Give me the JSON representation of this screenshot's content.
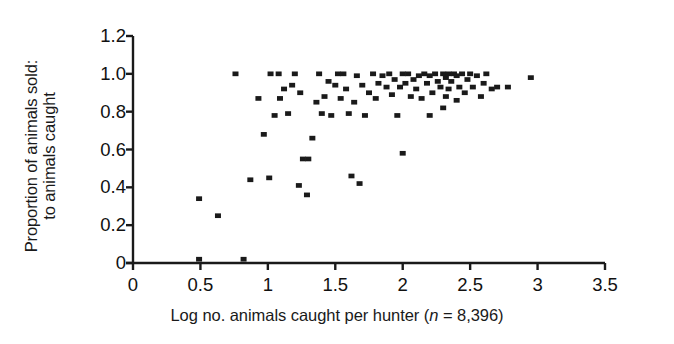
{
  "chart_data": {
    "type": "scatter",
    "title": "",
    "xlabel": "Log no. animals caught per hunter (n = 8,396)",
    "xlabel_parts": {
      "before": "Log no. animals caught per hunter (",
      "italic": "n",
      "after": " = 8,396)"
    },
    "ylabel": "Proportion of animals sold: to animals caught",
    "ylabel_lines": [
      "Proportion of animals sold:",
      "to animals caught"
    ],
    "xlim": [
      0,
      3.5
    ],
    "ylim": [
      0,
      1.2
    ],
    "xticks": [
      0,
      0.5,
      1,
      1.5,
      2,
      2.5,
      3,
      3.5
    ],
    "xtick_labels": [
      "0",
      "0.5",
      "1",
      "1.5",
      "2",
      "2.5",
      "3",
      "3.5"
    ],
    "yticks": [
      0,
      0.2,
      0.4,
      0.6,
      0.8,
      1.0,
      1.2
    ],
    "ytick_labels": [
      "0",
      "0.2",
      "0.4",
      "0.6",
      "0.8",
      "1.0",
      "1.2"
    ],
    "grid": false,
    "legend": null,
    "marker": "square",
    "marker_color": "#1a1a1a",
    "marker_size_px": 6,
    "n_points": 93,
    "points": [
      [
        0.49,
        0.02
      ],
      [
        0.49,
        0.34
      ],
      [
        0.63,
        0.25
      ],
      [
        0.76,
        1.0
      ],
      [
        0.82,
        0.02
      ],
      [
        0.87,
        0.44
      ],
      [
        0.93,
        0.87
      ],
      [
        0.97,
        0.68
      ],
      [
        1.01,
        0.45
      ],
      [
        1.02,
        1.0
      ],
      [
        1.05,
        0.78
      ],
      [
        1.08,
        1.0
      ],
      [
        1.09,
        0.87
      ],
      [
        1.12,
        0.92
      ],
      [
        1.15,
        0.79
      ],
      [
        1.18,
        0.94
      ],
      [
        1.2,
        1.0
      ],
      [
        1.23,
        0.41
      ],
      [
        1.24,
        0.9
      ],
      [
        1.26,
        0.55
      ],
      [
        1.29,
        0.36
      ],
      [
        1.3,
        0.55
      ],
      [
        1.33,
        0.66
      ],
      [
        1.36,
        0.85
      ],
      [
        1.38,
        1.0
      ],
      [
        1.4,
        0.79
      ],
      [
        1.42,
        0.88
      ],
      [
        1.45,
        0.96
      ],
      [
        1.47,
        0.78
      ],
      [
        1.5,
        0.94
      ],
      [
        1.52,
        1.0
      ],
      [
        1.54,
        0.87
      ],
      [
        1.56,
        1.0
      ],
      [
        1.58,
        0.92
      ],
      [
        1.6,
        0.79
      ],
      [
        1.62,
        0.46
      ],
      [
        1.64,
        0.85
      ],
      [
        1.66,
        0.99
      ],
      [
        1.68,
        0.42
      ],
      [
        1.7,
        0.94
      ],
      [
        1.72,
        0.78
      ],
      [
        1.75,
        0.9
      ],
      [
        1.78,
        1.0
      ],
      [
        1.8,
        0.87
      ],
      [
        1.82,
        0.95
      ],
      [
        1.85,
        0.99
      ],
      [
        1.88,
        0.93
      ],
      [
        1.9,
        1.0
      ],
      [
        1.92,
        0.89
      ],
      [
        1.94,
        0.97
      ],
      [
        1.96,
        0.78
      ],
      [
        1.98,
        0.93
      ],
      [
        2.0,
        0.58
      ],
      [
        2.0,
        1.0
      ],
      [
        2.02,
        0.95
      ],
      [
        2.04,
        1.0
      ],
      [
        2.06,
        0.88
      ],
      [
        2.08,
        0.97
      ],
      [
        2.1,
        0.92
      ],
      [
        2.12,
        0.99
      ],
      [
        2.14,
        0.87
      ],
      [
        2.16,
        1.0
      ],
      [
        2.18,
        0.95
      ],
      [
        2.2,
        0.78
      ],
      [
        2.2,
        0.99
      ],
      [
        2.22,
        0.9
      ],
      [
        2.24,
        1.0
      ],
      [
        2.26,
        0.96
      ],
      [
        2.28,
        0.93
      ],
      [
        2.3,
        1.0
      ],
      [
        2.3,
        0.82
      ],
      [
        2.32,
        0.98
      ],
      [
        2.32,
        0.88
      ],
      [
        2.34,
        1.0
      ],
      [
        2.34,
        0.92
      ],
      [
        2.36,
        0.96
      ],
      [
        2.38,
        1.0
      ],
      [
        2.4,
        0.86
      ],
      [
        2.4,
        0.99
      ],
      [
        2.42,
        0.93
      ],
      [
        2.44,
        1.0
      ],
      [
        2.46,
        0.9
      ],
      [
        2.48,
        0.97
      ],
      [
        2.5,
        1.0
      ],
      [
        2.52,
        0.93
      ],
      [
        2.55,
        0.99
      ],
      [
        2.58,
        0.88
      ],
      [
        2.6,
        0.95
      ],
      [
        2.62,
        1.0
      ],
      [
        2.66,
        0.92
      ],
      [
        2.7,
        0.93
      ],
      [
        2.78,
        0.93
      ],
      [
        2.95,
        0.98
      ]
    ]
  },
  "axis": {
    "line_color": "#1a1a1a",
    "line_width_px": 2.4,
    "tick_length_px": 7
  }
}
